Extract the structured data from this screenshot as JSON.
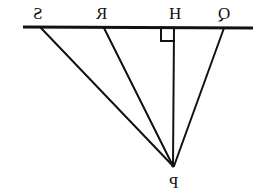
{
  "figure": {
    "kind": "geometry-diagram",
    "mirrored": true,
    "background_color": "#ffffff",
    "ink_color": "#121212",
    "line_width": 2,
    "labels": {
      "S": "S",
      "R": "R",
      "H": "H",
      "Q": "Q",
      "P": "P"
    },
    "points": {
      "S": {
        "x": 41,
        "y": 27
      },
      "R": {
        "x": 104,
        "y": 27
      },
      "H": {
        "x": 174,
        "y": 27
      },
      "Q": {
        "x": 224,
        "y": 27
      },
      "P": {
        "x": 173,
        "y": 166
      }
    },
    "baseline": {
      "name": "horizontal-line",
      "x1": 23,
      "y1": 27,
      "x2": 253,
      "y2": 28
    },
    "segments": [
      {
        "name": "segment-SP",
        "from": "S",
        "to": "P"
      },
      {
        "name": "segment-RP",
        "from": "R",
        "to": "P"
      },
      {
        "name": "segment-HP",
        "from": "H",
        "to": "P"
      },
      {
        "name": "segment-QP",
        "from": "Q",
        "to": "P"
      }
    ],
    "right_angle_marker": {
      "at": "H",
      "x": 161,
      "y": 28,
      "size": 13
    }
  }
}
